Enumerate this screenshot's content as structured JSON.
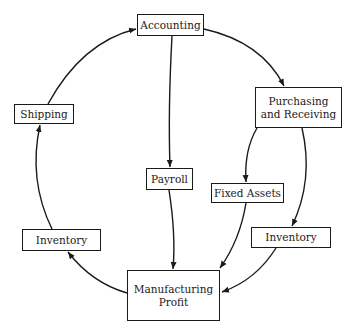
{
  "diagram": {
    "type": "flow-cycle",
    "colors": {
      "line": "#1a1a1a",
      "background": "#ffffff"
    },
    "nodes": {
      "accounting": {
        "label": "Accounting"
      },
      "purchasing": {
        "line1": "Purchasing",
        "line2": "and Receiving"
      },
      "shipping": {
        "label": "Shipping"
      },
      "payroll": {
        "label": "Payroll"
      },
      "fixed_assets": {
        "label": "Fixed Assets"
      },
      "inventory_left": {
        "label": "Inventory"
      },
      "inventory_right": {
        "label": "Inventory"
      },
      "manufacturing": {
        "line1": "Manufacturing",
        "line2": "Profit"
      }
    },
    "edges": [
      {
        "from": "Accounting",
        "to": "Purchasing and Receiving"
      },
      {
        "from": "Accounting",
        "to": "Payroll"
      },
      {
        "from": "Purchasing and Receiving",
        "to": "Fixed Assets"
      },
      {
        "from": "Purchasing and Receiving",
        "to": "Inventory (right)"
      },
      {
        "from": "Payroll",
        "to": "Manufacturing Profit"
      },
      {
        "from": "Fixed Assets",
        "to": "Manufacturing Profit"
      },
      {
        "from": "Inventory (right)",
        "to": "Manufacturing Profit"
      },
      {
        "from": "Manufacturing Profit",
        "to": "Inventory (left)"
      },
      {
        "from": "Inventory (left)",
        "to": "Shipping"
      },
      {
        "from": "Shipping",
        "to": "Accounting"
      }
    ]
  }
}
